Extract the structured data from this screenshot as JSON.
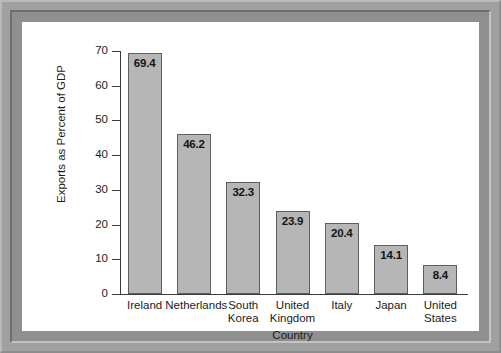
{
  "chart_data": {
    "type": "bar",
    "title": "",
    "xlabel": "Country",
    "ylabel": "Exports as Percent of GDP",
    "categories": [
      "Ireland",
      "Netherlands",
      "South Korea",
      "United Kingdom",
      "Italy",
      "Japan",
      "United States"
    ],
    "category_lines": [
      [
        "Ireland"
      ],
      [
        "Netherlands"
      ],
      [
        "South",
        "Korea"
      ],
      [
        "United",
        "Kingdom"
      ],
      [
        "Italy"
      ],
      [
        "Japan"
      ],
      [
        "United",
        "States"
      ]
    ],
    "values": [
      69.4,
      46.2,
      32.3,
      23.9,
      20.4,
      14.1,
      8.4
    ],
    "value_labels": [
      "69.4",
      "46.2",
      "32.3",
      "23.9",
      "20.4",
      "14.1",
      "8.4"
    ],
    "ylim": [
      0,
      70
    ],
    "ytick_labels": [
      "70",
      "60",
      "50",
      "40",
      "30",
      "20",
      "10",
      "0"
    ],
    "ytick_values": [
      70,
      60,
      50,
      40,
      30,
      20,
      10,
      0
    ],
    "grid": false,
    "legend": null,
    "bar_color": "#b6b6b6",
    "bar_border_color": "#5e5e5e",
    "axis_color": "#3a3a3a",
    "text_color": "#1c1c1c",
    "panel_background": "#ffffff",
    "frame_color": "#8f8f8f"
  }
}
